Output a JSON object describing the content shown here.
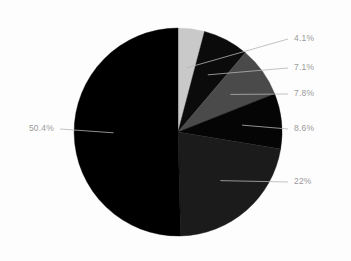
{
  "chart_data": {
    "type": "pie",
    "title": "",
    "subtitle": "",
    "xlabel": "",
    "ylabel": "",
    "legend_position": "none",
    "grid": false,
    "labels_format": "percent",
    "start_angle_deg": 0,
    "direction": "clockwise",
    "categories": [
      "Slice 1",
      "Slice 2",
      "Slice 3",
      "Slice 4",
      "Slice 5",
      "Slice 6"
    ],
    "values": [
      4.1,
      7.1,
      7.8,
      8.6,
      22.0,
      50.4
    ],
    "data_labels": [
      "4.1%",
      "7.1%",
      "7.8%",
      "8.6%",
      "22%",
      "50.4%"
    ],
    "colors": [
      "#c9c9c9",
      "#0b0b0b",
      "#4a4a4a",
      "#050505",
      "#1b1b1b",
      "#000000"
    ],
    "total": 100.0
  },
  "geometry": {
    "center_x": 178,
    "center_y": 132,
    "radius": 104
  },
  "style": {
    "background": "#fdfdfd",
    "label_color": "#9a9a9a",
    "leader_line_color": "#b4b4b4"
  },
  "slices": [
    {
      "label": "4.1%",
      "value": 4.1,
      "color": "#c9c9c9",
      "label_x": 294,
      "label_y": 39,
      "side": "right"
    },
    {
      "label": "7.1%",
      "value": 7.1,
      "color": "#0b0b0b",
      "label_x": 294,
      "label_y": 68,
      "side": "right"
    },
    {
      "label": "7.8%",
      "value": 7.8,
      "color": "#4a4a4a",
      "label_x": 294,
      "label_y": 94,
      "side": "right"
    },
    {
      "label": "8.6%",
      "value": 8.6,
      "color": "#050505",
      "label_x": 294,
      "label_y": 129,
      "side": "right"
    },
    {
      "label": "22%",
      "value": 22.0,
      "color": "#1b1b1b",
      "label_x": 294,
      "label_y": 182,
      "side": "right"
    },
    {
      "label": "50.4%",
      "value": 50.4,
      "color": "#000000",
      "label_x": 54,
      "label_y": 129,
      "side": "left"
    }
  ]
}
